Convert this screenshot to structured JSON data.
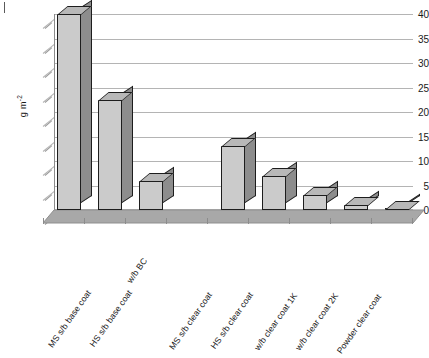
{
  "chart_data": {
    "type": "bar",
    "title": "",
    "subtitle": "",
    "xlabel": "",
    "ylabel": "g m-2",
    "ylabel_display": "g m",
    "ylabel_exponent": "-2",
    "ylim": [
      0,
      40
    ],
    "ytick_labels": [
      "0",
      "5",
      "10",
      "15",
      "20",
      "25",
      "30",
      "35",
      "40"
    ],
    "ytick_values": [
      0,
      5,
      10,
      15,
      20,
      25,
      30,
      35,
      40
    ],
    "grid": true,
    "legend": false,
    "legend_position": "none",
    "style": "3d-column",
    "categories": [
      "MS s/b base coat",
      "HS s/b base coat",
      "w/b BC",
      "",
      "MS s/b clear coat",
      "HS s/b clear coat",
      "w/b clear coat 1K",
      "w/b clear coat 2K",
      "Powder clear coat"
    ],
    "values": [
      40,
      22.5,
      6,
      null,
      13,
      7,
      3,
      1,
      0.3
    ],
    "series": [
      {
        "name": "VOC emission",
        "values": [
          40,
          22.5,
          6,
          null,
          13,
          7,
          3,
          1,
          0.3
        ]
      }
    ]
  },
  "colors": {
    "bar_front": "#cbcbcb",
    "bar_side": "#8d8d8d",
    "bar_top": "#b8b8b8",
    "bar_outline": "#1d1d1d",
    "gridline": "#b4b4b4",
    "axis": "#8c8c8c",
    "floor": "#a8a8a8",
    "floor_edge": "#8f8f8f",
    "text": "#1a1a1a",
    "background": "#ffffff"
  }
}
